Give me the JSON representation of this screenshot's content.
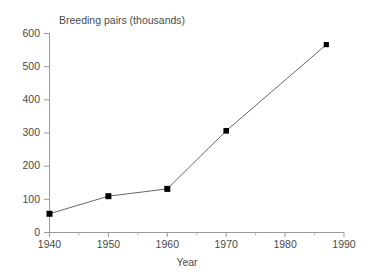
{
  "chart_data": {
    "type": "line",
    "title": "Breeding pairs (thousands)",
    "xlabel": "Year",
    "ylabel": "",
    "x": [
      1940,
      1950,
      1960,
      1970,
      1987
    ],
    "values": [
      55,
      108,
      130,
      305,
      565
    ],
    "series": [
      {
        "name": "Breeding pairs",
        "x": [
          1940,
          1950,
          1960,
          1970,
          1987
        ],
        "values": [
          55,
          108,
          130,
          305,
          565
        ]
      }
    ],
    "xlim": [
      1940,
      1990
    ],
    "ylim": [
      0,
      600
    ],
    "xticks": [
      1940,
      1950,
      1960,
      1970,
      1980,
      1990
    ],
    "xtick_labels": [
      "1940",
      "1950",
      "1960",
      "1970",
      "1980",
      "1990"
    ],
    "xminor_ticks": [
      1945,
      1955,
      1965,
      1975,
      1985
    ],
    "yticks": [
      0,
      100,
      200,
      300,
      400,
      500,
      600
    ],
    "ytick_labels": [
      "0",
      "100",
      "200",
      "300",
      "400",
      "500",
      "600"
    ],
    "grid": false,
    "legend": "none",
    "marker": "square",
    "marker_color": "#000000",
    "line_color": "#555555",
    "axis_color": "#9a9a9a",
    "background": "#ffffff"
  }
}
